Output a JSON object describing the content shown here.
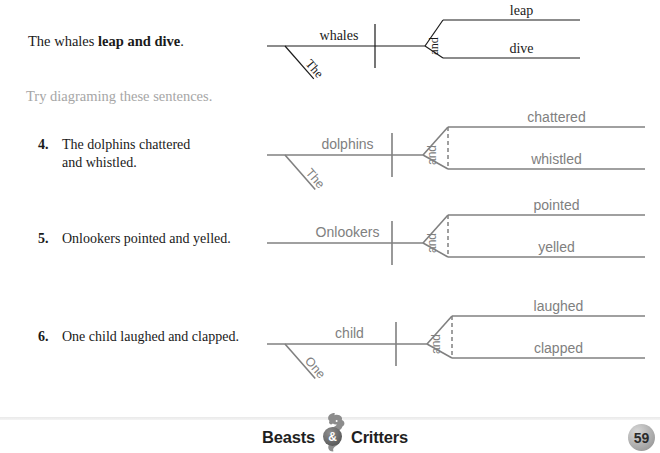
{
  "page": {
    "example_sentence_prefix": "The whales ",
    "example_sentence_bold": "leap and dive",
    "example_sentence_suffix": ".",
    "instruction": "Try diagraming these sentences."
  },
  "exercises": [
    {
      "number": "4.",
      "text": "The dolphins chattered\nand whistled."
    },
    {
      "number": "5.",
      "text": "Onlookers pointed and yelled."
    },
    {
      "number": "6.",
      "text": "One child laughed and clapped."
    }
  ],
  "diagrams": [
    {
      "id": "example",
      "style": "example",
      "subject": "whales",
      "article": "The",
      "conjunction": "and",
      "predicate_top": "leap",
      "predicate_bottom": "dive",
      "has_article": true,
      "has_dashed_connector": false,
      "color": "#1a1a1a"
    },
    {
      "id": "exercise-4",
      "style": "exercise",
      "subject": "dolphins",
      "article": "The",
      "conjunction": "and",
      "predicate_top": "chattered",
      "predicate_bottom": "whistled",
      "has_article": true,
      "has_dashed_connector": true,
      "color": "#808080"
    },
    {
      "id": "exercise-5",
      "style": "exercise",
      "subject": "Onlookers",
      "article": "",
      "conjunction": "and",
      "predicate_top": "pointed",
      "predicate_bottom": "yelled",
      "has_article": false,
      "has_dashed_connector": true,
      "color": "#808080"
    },
    {
      "id": "exercise-6",
      "style": "exercise",
      "subject": "child",
      "article": "One",
      "conjunction": "and",
      "predicate_top": "laughed",
      "predicate_bottom": "clapped",
      "has_article": true,
      "has_dashed_connector": true,
      "color": "#808080"
    }
  ],
  "footer": {
    "logo_left": "Beasts",
    "logo_ampersand": "&",
    "logo_right": "Critters",
    "page_number": "59"
  }
}
